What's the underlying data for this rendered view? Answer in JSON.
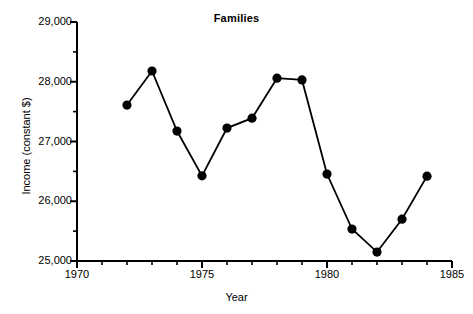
{
  "chart_data": {
    "type": "line",
    "title": "Families",
    "xlabel": "Year",
    "ylabel": "Income (constant $)",
    "xlim": [
      1970,
      1985
    ],
    "ylim": [
      25000,
      29000
    ],
    "x_major_ticks": [
      1970,
      1975,
      1980,
      1985
    ],
    "x_major_tick_labels": [
      "1970",
      "1975",
      "1980",
      "1985"
    ],
    "x_minor_tick_interval": 1,
    "y_major_ticks": [
      25000,
      26000,
      27000,
      28000,
      29000
    ],
    "y_major_tick_labels": [
      "25,000",
      "26,000",
      "27,000",
      "28,000",
      "29,000"
    ],
    "y_minor_tick_interval": 500,
    "grid": false,
    "legend": false,
    "marker": "filled-circle",
    "line_color": "#000000",
    "marker_color": "#000000",
    "background_color": "#ffffff",
    "x": [
      1972,
      1973,
      1974,
      1975,
      1976,
      1977,
      1978,
      1979,
      1980,
      1981,
      1982,
      1983,
      1984
    ],
    "values": [
      27610,
      28180,
      27175,
      26425,
      27225,
      27390,
      28060,
      28030,
      26455,
      25535,
      25150,
      25700,
      26420
    ],
    "series": [
      {
        "name": "Families",
        "values": [
          27610,
          28180,
          27175,
          26425,
          27225,
          27390,
          28060,
          28030,
          26455,
          25535,
          25150,
          25700,
          26420
        ]
      }
    ]
  },
  "axis": {
    "y_labels": [
      "29,000",
      "28,000",
      "27,000",
      "26,000",
      "25,000"
    ],
    "x_labels": [
      "1970",
      "1975",
      "1980",
      "1985"
    ]
  }
}
